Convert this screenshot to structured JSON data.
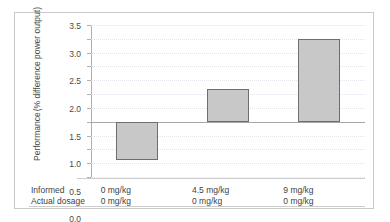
{
  "chart_data": {
    "type": "bar",
    "title": "",
    "xlabel": "",
    "ylabel": "Performance (% difference power output)",
    "ylabel_lines": [
      "Performance",
      "(% difference power output)"
    ],
    "categories": [
      "0 mg/kg",
      "4.5 mg/kg",
      "9 mg/kg"
    ],
    "values": [
      -1.4,
      1.2,
      3.0
    ],
    "ylim": [
      -2.0,
      3.5
    ],
    "yticks": [
      "3.5",
      "3.0",
      "2.5",
      "2.0",
      "1.5",
      "1.0",
      "0.5",
      "0.0",
      "-0.5",
      "-1.0",
      "-1.5",
      "-2.0"
    ],
    "ytick_values": [
      3.5,
      3.0,
      2.5,
      2.0,
      1.5,
      1.0,
      0.5,
      0.0,
      -0.5,
      -1.0,
      -1.5,
      -2.0
    ],
    "grid": true,
    "legend": "none",
    "bar_color": "#c8c8c8",
    "bar_edge_color": "#6e6e6e",
    "zero_line": 0.0
  },
  "table": {
    "rows": [
      {
        "label": "Informed",
        "cells": [
          "0 mg/kg",
          "4.5 mg/kg",
          "9 mg/kg"
        ]
      },
      {
        "label": "Actual dosage",
        "cells": [
          "0 mg/kg",
          "0 mg/kg",
          "0 mg/kg"
        ]
      }
    ]
  }
}
